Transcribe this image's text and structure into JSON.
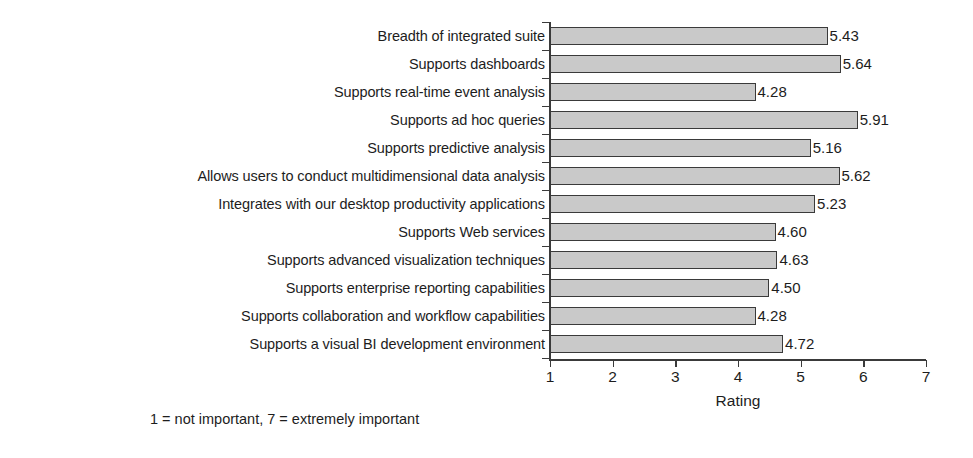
{
  "chart_data": {
    "type": "bar",
    "orientation": "horizontal",
    "title": "",
    "xlabel": "Rating",
    "ylabel": "",
    "xlim": [
      1,
      7
    ],
    "xticks": [
      "1",
      "2",
      "3",
      "4",
      "5",
      "6",
      "7"
    ],
    "grid": false,
    "legend": null,
    "footnote": "1 = not important, 7 = extremely important",
    "bar_color": "#c9c9c9",
    "bar_border_color": "#3a3a3a",
    "value_label_format": "0.00",
    "categories": [
      "Breadth of integrated suite",
      "Supports dashboards",
      "Supports real-time event analysis",
      "Supports ad hoc queries",
      "Supports predictive analysis",
      "Allows users to conduct multidimensional data analysis",
      "Integrates with our desktop productivity applications",
      "Supports Web services",
      "Supports advanced visualization techniques",
      "Supports enterprise reporting capabilities",
      "Supports collaboration and workflow capabilities",
      "Supports a visual BI development environment"
    ],
    "values": [
      5.43,
      5.64,
      4.28,
      5.91,
      5.16,
      5.62,
      5.23,
      4.6,
      4.63,
      4.5,
      4.28,
      4.72
    ],
    "value_labels": [
      "5.43",
      "5.64",
      "4.28",
      "5.91",
      "5.16",
      "5.62",
      "5.23",
      "4.60",
      "4.63",
      "4.50",
      "4.28",
      "4.72"
    ]
  }
}
